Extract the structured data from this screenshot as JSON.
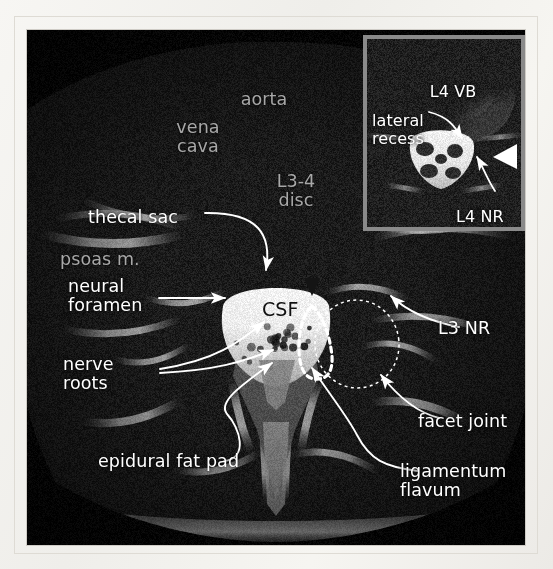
{
  "figure": {
    "modality": "MRI",
    "view": "axial T2 lumbar spine at L3-4",
    "csf_label": "CSF"
  },
  "main_labels": [
    {
      "id": "aorta",
      "text": "aorta",
      "style": "dim",
      "x": 236,
      "y": 70,
      "align": "center"
    },
    {
      "id": "vena-cava",
      "text": "vena\ncava",
      "style": "dim",
      "x": 170,
      "y": 98,
      "align": "center"
    },
    {
      "id": "l3-4-disc",
      "text": "L3-4\ndisc",
      "style": "dim",
      "x": 268,
      "y": 152,
      "align": "center"
    },
    {
      "id": "thecal-sac",
      "text": "thecal sac",
      "style": "white",
      "x": 88,
      "y": 188,
      "align": "left"
    },
    {
      "id": "psoas-m",
      "text": "psoas m.",
      "style": "dim",
      "x": 60,
      "y": 229,
      "align": "left"
    },
    {
      "id": "neural-foramen",
      "text": "neural\nforamen",
      "style": "white",
      "x": 68,
      "y": 266,
      "align": "left"
    },
    {
      "id": "csf",
      "text": "CSF",
      "style": "dark",
      "x": 262,
      "y": 280,
      "align": "left"
    },
    {
      "id": "l3-nr",
      "text": "L3 NR",
      "style": "white",
      "x": 438,
      "y": 299,
      "align": "left"
    },
    {
      "id": "nerve-roots",
      "text": "nerve\nroots",
      "style": "white",
      "x": 63,
      "y": 344,
      "align": "left"
    },
    {
      "id": "facet-joint",
      "text": "facet joint",
      "style": "white",
      "x": 418,
      "y": 392,
      "align": "left"
    },
    {
      "id": "epidural-fat-pad",
      "text": "epidural fat pad",
      "style": "white",
      "x": 98,
      "y": 432,
      "align": "left"
    },
    {
      "id": "ligamentum-flavum",
      "text": "ligamentum\nflavum",
      "style": "white",
      "x": 400,
      "y": 443,
      "align": "left"
    }
  ],
  "inset_labels": [
    {
      "id": "l4-vb",
      "text": "L4 VB",
      "style": "white",
      "x": 424,
      "y": 63,
      "align": "center"
    },
    {
      "id": "lateral-recess",
      "text": "lateral\nrecess",
      "style": "white",
      "x": 372,
      "y": 92,
      "align": "left"
    },
    {
      "id": "l4-nr",
      "text": "L4 NR",
      "style": "white",
      "x": 456,
      "y": 188,
      "align": "left"
    }
  ],
  "markers": [
    {
      "id": "white-arrowhead-inset",
      "kind": "triangle",
      "color": "#ffffff",
      "note": "solid white arrowhead, points left, right edge of inset"
    },
    {
      "id": "dark-arrowhead-csf",
      "kind": "triangle",
      "color": "#1b1b1b",
      "note": "solid dark arrowhead, points down, top of thecal sac"
    }
  ],
  "outlines": [
    {
      "id": "ligamentum-flavum-outline",
      "kind": "dashed-polygon",
      "color": "#ffffff",
      "weight": "heavy"
    },
    {
      "id": "facet-joint-outline",
      "kind": "dashed-ellipse",
      "color": "#ffffff",
      "weight": "fine"
    }
  ],
  "colors": {
    "page_bg": "#f4f2ee",
    "plate_bg": "#070707",
    "label_white": "#ffffff",
    "label_dim": "#a8a8a8",
    "label_dark": "#111111",
    "inset_border": "#8a8a8a",
    "leader_line": "#ffffff"
  }
}
